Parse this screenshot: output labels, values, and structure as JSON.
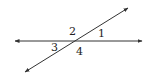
{
  "diagram": {
    "type": "intersecting-lines",
    "lines": [
      {
        "name": "horizontal-line",
        "x1": 15,
        "y1": 41,
        "x2": 142,
        "y2": 41,
        "arrows": "both"
      },
      {
        "name": "transversal-line",
        "x1": 25,
        "y1": 72,
        "x2": 128,
        "y2": 8,
        "arrows": "both"
      }
    ],
    "angle_labels": [
      {
        "id": "2",
        "text": "2",
        "x": 69,
        "y": 35
      },
      {
        "id": "1",
        "text": "1",
        "x": 98,
        "y": 37
      },
      {
        "id": "3",
        "text": "3",
        "x": 51,
        "y": 51
      },
      {
        "id": "4",
        "text": "4",
        "x": 76,
        "y": 55
      }
    ],
    "stroke_color": "#333333"
  }
}
